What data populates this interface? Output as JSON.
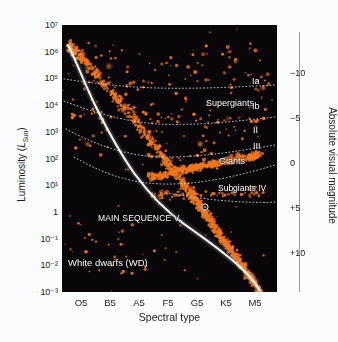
{
  "chart_data": {
    "type": "scatter",
    "xlabel": "Spectral type",
    "ylabel": "Luminosity (L_Sun)",
    "y2label": "Absolute visual magnitude",
    "grid": false,
    "legend": "none",
    "xticks": [
      "O5",
      "B5",
      "A5",
      "F5",
      "G5",
      "K5",
      "M5"
    ],
    "yticks": [
      "10⁷",
      "10⁶",
      "10⁵",
      "10⁴",
      "10³",
      "10²",
      "10¹",
      "1",
      "10⁻¹",
      "10⁻²",
      "10⁻³"
    ],
    "ylim": [
      0.001,
      10000000
    ],
    "y2ticks": [
      "−10",
      "−5",
      "0",
      "+5",
      "+10"
    ],
    "y2lim": [
      12.5,
      -11.5
    ],
    "background": "#080608",
    "point_color": "#f0761c",
    "curve_color": "#ffffff",
    "annotations": [
      {
        "text": "Ia",
        "x": 0.895,
        "y": 0.215
      },
      {
        "text": "Supergiants",
        "x": 0.7,
        "y": 0.295
      },
      {
        "text": "Ib",
        "x": 0.895,
        "y": 0.305
      },
      {
        "text": "II",
        "x": 0.895,
        "y": 0.395
      },
      {
        "text": "III",
        "x": 0.905,
        "y": 0.455
      },
      {
        "text": "Giants",
        "x": 0.755,
        "y": 0.505
      },
      {
        "text": "Subgiants IV",
        "x": 0.78,
        "y": 0.605
      },
      {
        "text": "MAIN SEQUENCE V",
        "x": 0.22,
        "y": 0.715
      },
      {
        "text": "White dwarfs (WD)",
        "x": 0.03,
        "y": 0.875
      }
    ],
    "sun_marker": {
      "x": 0.665,
      "y": 0.682,
      "label": "Sun"
    },
    "luminosity_class_curves": [
      {
        "name": "Ia",
        "style": "dotted"
      },
      {
        "name": "Ib",
        "style": "dotted"
      },
      {
        "name": "II",
        "style": "dotted"
      },
      {
        "name": "III",
        "style": "dotted"
      },
      {
        "name": "IV",
        "style": "dotted"
      }
    ],
    "main_sequence_curve": {
      "name": "Main sequence V",
      "style": "solid",
      "color": "#ffffff"
    },
    "series": [
      {
        "name": "Stars",
        "point_color": "#f0761c",
        "n_points": 1200
      }
    ]
  },
  "axes": {
    "y_title_prefix": "Luminosity (",
    "y_title_italic": "L",
    "y_title_sub": "Sun",
    "y_title_suffix": ")",
    "x_title": "Spectral type",
    "y2_title": "Absolute visual magnitude"
  }
}
